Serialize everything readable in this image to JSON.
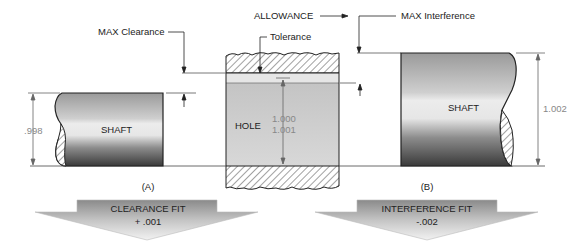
{
  "labels": {
    "max_clearance": "MAX Clearance",
    "allowance": "ALLOWANCE",
    "max_interference": "MAX Interference",
    "tolerance": "Tolerance",
    "hole": "HOLE",
    "hole_dim_min": "1.000",
    "hole_dim_max": "1.001",
    "shaft_left": "SHAFT",
    "shaft_left_dim": ".998",
    "shaft_right": "SHAFT",
    "shaft_right_dim": "1.002",
    "caption_a": "(A)",
    "caption_b": "(B)"
  },
  "arrows": {
    "left": {
      "title": "CLEARANCE FIT",
      "value": "+ .001"
    },
    "right": {
      "title": "INTERFERENCE FIT",
      "value": "-.002"
    }
  },
  "colors": {
    "outline": "#222222",
    "dim_line": "#555555",
    "hole_fill": "#c9c9c9",
    "clearance_band": "#e4e4e4",
    "arrow_fill_top": "#8a8a8a",
    "arrow_fill_bottom": "#ededed"
  }
}
